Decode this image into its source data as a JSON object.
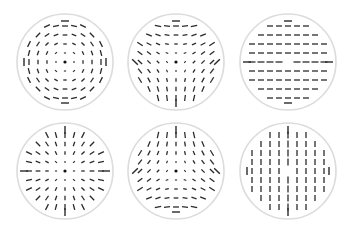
{
  "figure": {
    "width": 353,
    "height": 230,
    "colors": {
      "background": "#ffffff",
      "ring": "#dcdcdc",
      "segment": "#2a2a2a",
      "center_dot": "#111111"
    }
  },
  "panels": [
    {
      "id": "rotational-field",
      "cx": 65,
      "cy": 62,
      "r": 48,
      "grid": 9,
      "mode": "charge",
      "k": 1,
      "offset_deg": 90,
      "length": "radial",
      "center_dot": true
    },
    {
      "id": "half-defect-down",
      "cx": 176,
      "cy": 62,
      "r": 48,
      "grid": 9,
      "mode": "charge",
      "k": -0.5,
      "offset_deg": -45,
      "length": "radial",
      "center_dot": true
    },
    {
      "id": "uniform-horizontal",
      "cx": 288,
      "cy": 62,
      "r": 48,
      "grid": 9,
      "mode": "uniform",
      "angle_deg": 0,
      "length": "constant",
      "center_dot": false
    },
    {
      "id": "radial-field",
      "cx": 65,
      "cy": 171,
      "r": 48,
      "grid": 9,
      "mode": "charge",
      "k": 1,
      "offset_deg": 0,
      "length": "radial",
      "center_dot": true
    },
    {
      "id": "half-defect-up",
      "cx": 176,
      "cy": 171,
      "r": 48,
      "grid": 9,
      "mode": "charge",
      "k": -0.5,
      "offset_deg": 45,
      "length": "radial",
      "center_dot": true
    },
    {
      "id": "uniform-vertical",
      "cx": 288,
      "cy": 171,
      "r": 48,
      "grid": 9,
      "mode": "uniform",
      "angle_deg": 90,
      "length": "constant",
      "center_dot": false
    }
  ]
}
